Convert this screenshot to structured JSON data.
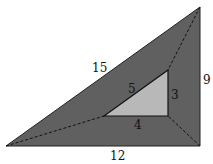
{
  "diagram": {
    "type": "nested right triangles",
    "outer_triangle": {
      "vertices": [
        [
          6,
          146
        ],
        [
          200,
          7
        ],
        [
          200,
          146
        ]
      ],
      "fill": "#606060",
      "side_labels": {
        "hypotenuse": "15",
        "vertical_leg": "9",
        "horizontal_leg": "12"
      }
    },
    "inner_triangle": {
      "vertices": [
        [
          104,
          116
        ],
        [
          168,
          70
        ],
        [
          168,
          116
        ]
      ],
      "fill": "#b8b8b8",
      "side_labels": {
        "hypotenuse": "5",
        "vertical_leg": "3",
        "horizontal_leg": "4"
      }
    },
    "connectors": {
      "style": "dashed",
      "pairs": [
        [
          [
            6,
            146
          ],
          [
            104,
            116
          ]
        ],
        [
          [
            200,
            7
          ],
          [
            168,
            70
          ]
        ],
        [
          [
            200,
            146
          ],
          [
            168,
            116
          ]
        ]
      ]
    }
  }
}
